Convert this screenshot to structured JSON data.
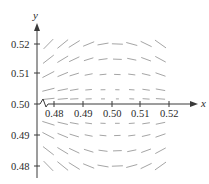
{
  "figure": {
    "type": "slope_field",
    "x_axis_label": "x",
    "y_axis_label": "y",
    "x_ticks": [
      "0.48",
      "0.49",
      "0.50",
      "0.51",
      "0.52"
    ],
    "y_ticks": [
      "0.52",
      "0.51",
      "0.50",
      "0.49",
      "0.48"
    ],
    "axis_break_symbol": "zigzag",
    "colors": {
      "axis": "#3a3a3a",
      "segments": "#9a9a9a",
      "text": "#2a2a2a"
    }
  },
  "chart_data": {
    "type": "slope_field",
    "title": "",
    "xlabel": "x",
    "ylabel": "y",
    "xlim": [
      0.475,
      0.525
    ],
    "ylim": [
      0.475,
      0.525
    ],
    "x_ticks": [
      0.48,
      0.49,
      0.5,
      0.51,
      0.52
    ],
    "y_ticks": [
      0.48,
      0.49,
      0.5,
      0.51,
      0.52
    ],
    "grid_x": [
      0.477,
      0.482,
      0.486,
      0.491,
      0.496,
      0.501,
      0.506,
      0.511,
      0.516
    ],
    "grid_y": [
      0.52,
      0.515,
      0.51,
      0.505,
      0.502,
      0.494,
      0.49,
      0.485,
      0.48
    ],
    "pattern": "segments near (0.5,0.5) are short/nearly point-like; upper-left slopes slightly positive, upper-right slopes negative, lower-left slopes negative, lower-right slopes positive",
    "annotations": [
      "axis break near origin on x-axis"
    ]
  }
}
